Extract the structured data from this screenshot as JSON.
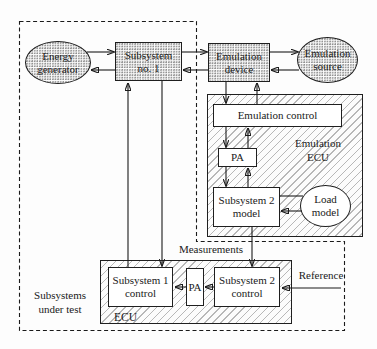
{
  "diagram": {
    "nodes": {
      "energy_generator": "Energy generator",
      "subsystem1": "Subsystem no. 1",
      "emulation_device": "Emulation device",
      "emulation_source": "Emulation source",
      "emulation_control": "Emulation control",
      "pa_top": "PA",
      "subsystem2_model": "Subsystem 2 model",
      "load_model": "Load model",
      "subsystem1_control": "Subsystem 1 control",
      "pa_bottom": "PA",
      "subsystem2_control": "Subsystem 2 control"
    },
    "labels": {
      "emulation_ecu": "Emulation ECU",
      "ecu": "ECU",
      "measurements": "Measurements",
      "reference": "Reference",
      "subsystems_under_test": "Subsystems under test"
    },
    "colors": {
      "line": "#1a1a1a",
      "hatch_stroke": "#b8b8b8",
      "stipple_dot": "#8f8f8f",
      "box_fill": "#ffffff",
      "background": "#fdfdfd"
    }
  }
}
